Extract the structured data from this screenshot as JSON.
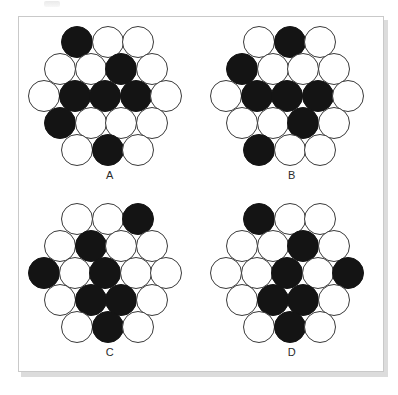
{
  "figure": {
    "kind": "multiple-choice-figure-panel",
    "panel_count": 4,
    "colors": {
      "filled_circle": "#141414",
      "empty_circle": "#ffffff",
      "circle_outline": "#3a3a3a",
      "frame_border": "#c9c9c9",
      "background": "#ffffff",
      "label_text": "#2b2b2b"
    },
    "lattice": {
      "shape": "hexagon",
      "row_counts": [
        3,
        4,
        5,
        4,
        3
      ],
      "total_circles": 19,
      "row_offsets_px": [
        33,
        16,
        0,
        16,
        33
      ]
    },
    "panels": [
      {
        "label": "A",
        "filled_count": 6,
        "rows": [
          [
            true,
            false,
            false
          ],
          [
            false,
            false,
            true,
            false
          ],
          [
            false,
            true,
            true,
            true,
            false
          ],
          [
            true,
            false,
            false,
            false
          ],
          [
            false,
            true,
            false
          ]
        ]
      },
      {
        "label": "B",
        "filled_count": 7,
        "rows": [
          [
            false,
            true,
            false
          ],
          [
            true,
            false,
            false,
            false
          ],
          [
            false,
            true,
            true,
            true,
            false
          ],
          [
            false,
            false,
            true,
            false
          ],
          [
            true,
            false,
            false
          ]
        ]
      },
      {
        "label": "C",
        "filled_count": 6,
        "rows": [
          [
            false,
            false,
            true
          ],
          [
            false,
            true,
            false,
            false
          ],
          [
            true,
            false,
            true,
            false,
            false
          ],
          [
            false,
            true,
            true,
            false
          ],
          [
            false,
            true,
            false
          ]
        ]
      },
      {
        "label": "D",
        "filled_count": 6,
        "rows": [
          [
            true,
            false,
            false
          ],
          [
            false,
            false,
            true,
            false
          ],
          [
            false,
            false,
            true,
            false,
            true
          ],
          [
            false,
            true,
            true,
            false
          ],
          [
            false,
            true,
            false
          ]
        ]
      }
    ]
  }
}
